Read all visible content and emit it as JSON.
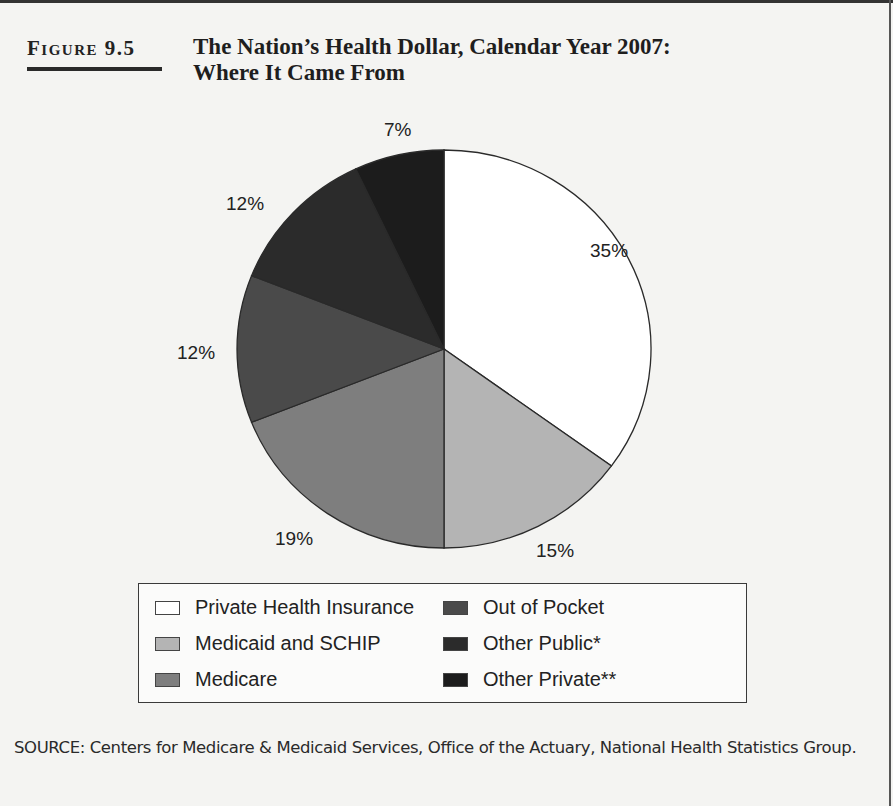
{
  "figure": {
    "label": "Figure 9.5",
    "title_line1": "The Nation’s Health Dollar, Calendar Year 2007:",
    "title_line2": "Where It Came From"
  },
  "chart_data": {
    "type": "pie",
    "title": "The Nation’s Health Dollar, Calendar Year 2007: Where It Came From",
    "start_angle_deg": 0,
    "direction": "clockwise",
    "categories": [
      "Private Health Insurance",
      "Medicaid and SCHIP",
      "Medicare",
      "Out of Pocket",
      "Other Public*",
      "Other Private**"
    ],
    "values": [
      35,
      15,
      19,
      12,
      12,
      7
    ],
    "labels": [
      "35%",
      "15%",
      "19%",
      "12%",
      "12%",
      "7%"
    ],
    "colors": [
      "#ffffff",
      "#b4b4b4",
      "#7e7e7e",
      "#4a4a4a",
      "#2b2b2b",
      "#1c1c1c"
    ],
    "legend_position": "bottom",
    "unit": "%"
  },
  "legend": {
    "items": [
      {
        "label": "Private Health Insurance",
        "color": "#ffffff"
      },
      {
        "label": "Medicaid and SCHIP",
        "color": "#b4b4b4"
      },
      {
        "label": "Medicare",
        "color": "#7e7e7e"
      },
      {
        "label": "Out of Pocket",
        "color": "#4a4a4a"
      },
      {
        "label": "Other Public*",
        "color": "#2b2b2b"
      },
      {
        "label": "Other Private**",
        "color": "#1c1c1c"
      }
    ]
  },
  "source": {
    "text": "SOURCE: Centers for Medicare & Medicaid Services, Office of the Actuary, National Health Statistics Group."
  }
}
